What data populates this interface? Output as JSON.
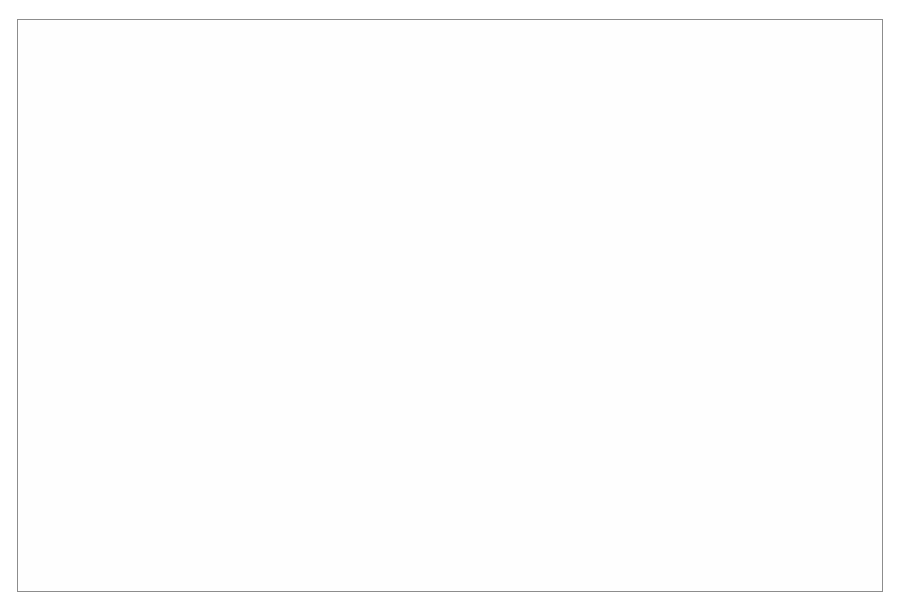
{
  "figure": {
    "background_color": "#ffffff",
    "border_color": "#8d8d8d",
    "line_color": "#141414",
    "grid_color": "#b9b9b9"
  },
  "chart_data": {
    "type": "line",
    "title": "",
    "subtitle": "",
    "xlabel": "",
    "ylabel": "index 1963 = 100",
    "xlim": [
      1930,
      2010
    ],
    "ylim": [
      0,
      400
    ],
    "xticks": [
      1930,
      1940,
      1950,
      1960,
      1970,
      1980,
      1990,
      2000,
      2010
    ],
    "xtick_labels": [
      "1930",
      "1940",
      "1950",
      "1960",
      "1970",
      "1980",
      "1990",
      "2000",
      "2010"
    ],
    "yticks": [
      0,
      100,
      200,
      300,
      400
    ],
    "ytick_labels": [
      "0",
      "100",
      "200",
      "300",
      "400"
    ],
    "grid": true,
    "legend_position": "inline-annotations",
    "annotations": [
      {
        "text": "total industrial production",
        "x": 1964,
        "y": 352,
        "series": "total_industrial_production"
      },
      {
        "text": "industrial production per capita",
        "x": 1972,
        "y": 118,
        "series": "industrial_production_per_capita"
      }
    ],
    "series": [
      {
        "name": "total industrial production",
        "style": "solid",
        "x": [
          1930,
          1931,
          1932,
          1933,
          1934,
          1935,
          1936,
          1937,
          1938,
          1939,
          1940,
          1941,
          1942,
          1943,
          1944,
          1945,
          1946,
          1947,
          1948,
          1949,
          1950,
          1951,
          1952,
          1953,
          1954,
          1955,
          1956,
          1957,
          1958,
          1959,
          1960,
          1961,
          1962,
          1963,
          1964,
          1965,
          1966,
          1967,
          1968,
          1969,
          1970,
          1971,
          1972,
          1973,
          1974,
          1975,
          1976,
          1977,
          1978,
          1979,
          1980,
          1981,
          1982,
          1983,
          1984,
          1985,
          1986,
          1987,
          1988,
          1989,
          1990,
          1991,
          1992,
          1993,
          1994,
          1995,
          1996,
          1997,
          1998,
          1999,
          2000
        ],
        "values": [
          28,
          21,
          18,
          21,
          24,
          27,
          31,
          38,
          34,
          35,
          36,
          37,
          38,
          39,
          40,
          41,
          43,
          45,
          48,
          49,
          52,
          56,
          58,
          61,
          62,
          66,
          69,
          71,
          73,
          77,
          80,
          84,
          88,
          100,
          106,
          113,
          121,
          128,
          139,
          152,
          163,
          160,
          172,
          195,
          192,
          188,
          200,
          214,
          226,
          237,
          236,
          228,
          224,
          232,
          240,
          246,
          257,
          269,
          283,
          303,
          300,
          292,
          297,
          305,
          316,
          326,
          340,
          355,
          368,
          384,
          400
        ]
      },
      {
        "name": "industrial production per capita",
        "style": "dashed",
        "x": [
          1930,
          1931,
          1932,
          1933,
          1934,
          1935,
          1936,
          1937,
          1938,
          1939,
          1940,
          1941,
          1942,
          1943,
          1944,
          1945,
          1946,
          1947,
          1948,
          1949,
          1950,
          1951,
          1952,
          1953,
          1954,
          1955,
          1956,
          1957,
          1958,
          1959,
          1960,
          1961,
          1962,
          1963,
          1964,
          1965,
          1966,
          1967,
          1968,
          1969,
          1970,
          1971,
          1972,
          1973,
          1974,
          1975,
          1976,
          1977,
          1978,
          1979,
          1980,
          1981,
          1982,
          1983,
          1984,
          1985,
          1986,
          1987,
          1988,
          1989,
          1990,
          1991,
          1992,
          1993,
          1994,
          1995,
          1996,
          1997,
          1998,
          1999,
          2000
        ],
        "values": [
          38,
          33,
          30,
          33,
          36,
          38,
          41,
          45,
          41,
          42,
          43,
          44,
          44,
          45,
          46,
          47,
          48,
          50,
          53,
          54,
          57,
          60,
          62,
          64,
          65,
          68,
          71,
          73,
          74,
          78,
          80,
          84,
          89,
          100,
          104,
          110,
          116,
          121,
          130,
          140,
          148,
          143,
          151,
          168,
          163,
          156,
          162,
          170,
          175,
          180,
          175,
          166,
          160,
          163,
          166,
          168,
          173,
          177,
          180,
          183,
          178,
          170,
          169,
          172,
          176,
          180,
          186,
          191,
          196,
          202,
          207
        ]
      }
    ]
  }
}
